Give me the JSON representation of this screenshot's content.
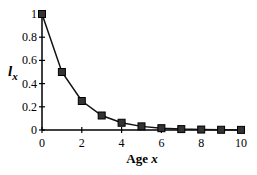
{
  "chart_data": {
    "type": "line",
    "title": "",
    "xlabel": "Age x",
    "ylabel": "l_x",
    "x": [
      0,
      1,
      2,
      3,
      4,
      5,
      6,
      7,
      8,
      9,
      10
    ],
    "series": [
      {
        "name": "l_x",
        "values": [
          1,
          0.5,
          0.25,
          0.125,
          0.0625,
          0.03125,
          0.015625,
          0.0078,
          0.0039,
          0.002,
          0.001
        ],
        "marker": "square"
      }
    ],
    "xlim": [
      0,
      10
    ],
    "ylim": [
      0,
      1
    ],
    "xticks": [
      "0",
      "2",
      "4",
      "6",
      "8",
      "10"
    ],
    "yticks": [
      "0",
      "0.2",
      "0.4",
      "0.6",
      "0.8",
      "1"
    ],
    "grid": false,
    "legend": "none"
  },
  "labels": {
    "ylabel_main": "l",
    "ylabel_sub": "x",
    "xlabel_main": "Age ",
    "xlabel_var": "x"
  },
  "colors": {
    "line": "#111111",
    "marker": "#333333"
  }
}
